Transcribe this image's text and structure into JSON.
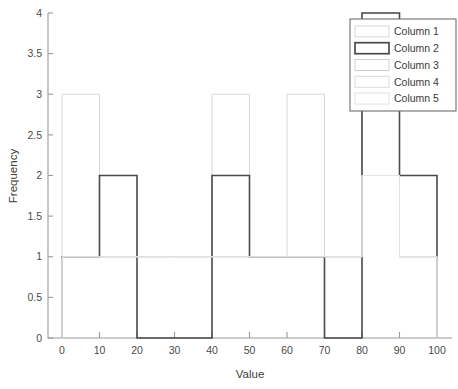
{
  "chart_data": {
    "type": "bar",
    "title": "",
    "xlabel": "Value",
    "ylabel": "Frequency",
    "xlim": [
      0,
      100
    ],
    "ylim": [
      0,
      4
    ],
    "grid": false,
    "bin_width": 10,
    "bin_edges": [
      0,
      10,
      20,
      30,
      40,
      50,
      60,
      70,
      80,
      90,
      100
    ],
    "categories": [
      "0-10",
      "10-20",
      "20-30",
      "30-40",
      "40-50",
      "50-60",
      "60-70",
      "70-80",
      "80-90",
      "90-100"
    ],
    "xticks": [
      "0",
      "10",
      "20",
      "30",
      "40",
      "50",
      "60",
      "70",
      "80",
      "90",
      "100"
    ],
    "yticks": [
      "0",
      "0.5",
      "1",
      "1.5",
      "2",
      "2.5",
      "3",
      "3.5",
      "4"
    ],
    "legend_position": "top-right",
    "series": [
      {
        "name": "Column 1",
        "color": "#d8d8d8",
        "linewidth": 1.0,
        "values": [
          3,
          1,
          1,
          1,
          3,
          1,
          3,
          1,
          4,
          1
        ]
      },
      {
        "name": "Column 2",
        "color": "#4a4a4a",
        "linewidth": 1.6,
        "values": [
          1,
          2,
          0,
          0,
          2,
          1,
          1,
          0,
          4,
          2
        ]
      },
      {
        "name": "Column 3",
        "color": "#cfcfcf",
        "linewidth": 1.0,
        "values": [
          1,
          1,
          1,
          1,
          1,
          1,
          1,
          1,
          2,
          1
        ]
      },
      {
        "name": "Column 4",
        "color": "#dcdcdc",
        "linewidth": 1.0,
        "values": [
          1,
          1,
          1,
          1,
          1,
          1,
          1,
          1,
          2,
          1
        ]
      },
      {
        "name": "Column 5",
        "color": "#e2e2e2",
        "linewidth": 1.0,
        "values": [
          1,
          1,
          1,
          1,
          1,
          1,
          1,
          1,
          2,
          1
        ]
      }
    ]
  },
  "axes": {
    "x_title": "Value",
    "y_title": "Frequency"
  },
  "legend": {
    "entries": [
      {
        "label": "Column 1",
        "swatch_color": "#d8d8d8"
      },
      {
        "label": "Column 2",
        "swatch_color": "#4a4a4a"
      },
      {
        "label": "Column 3",
        "swatch_color": "#cfcfcf"
      },
      {
        "label": "Column 4",
        "swatch_color": "#dcdcdc"
      },
      {
        "label": "Column 5",
        "swatch_color": "#e2e2e2"
      }
    ]
  },
  "colors": {
    "background": "#ffffff",
    "axis": "#9a9a9a",
    "text": "#3c3c3c",
    "dark_series": "#4a4a4a",
    "light_series": "#d8d8d8"
  }
}
